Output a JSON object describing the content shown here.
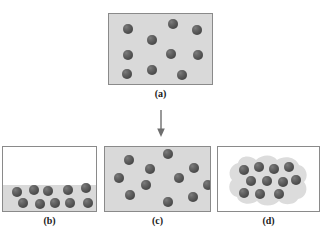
{
  "figure": {
    "background_color": "#ffffff",
    "panel_fill_color": "#d9d9d9",
    "panel_border_color": "#8a8a8a",
    "sphere_color": "#4e4e4e",
    "blob_color": "#dcdcdc"
  },
  "arrow": {
    "name": "down-arrow",
    "color": "#6e6e6e",
    "x": 161,
    "y_start": 110,
    "y_end": 137
  },
  "panels": [
    {
      "id": "a",
      "label": "(a)",
      "x": 108,
      "y": 13,
      "w": 105,
      "h": 72,
      "fill": "full",
      "label_x": 108,
      "label_y": 88,
      "label_w": 105,
      "sphere_count": 10,
      "sphere_radius": 5.2,
      "spheres": [
        {
          "cx": 19,
          "cy": 15
        },
        {
          "cx": 64,
          "cy": 10
        },
        {
          "cx": 88,
          "cy": 16
        },
        {
          "cx": 43,
          "cy": 26
        },
        {
          "cx": 19,
          "cy": 41
        },
        {
          "cx": 62,
          "cy": 40
        },
        {
          "cx": 89,
          "cy": 41
        },
        {
          "cx": 18,
          "cy": 60
        },
        {
          "cx": 43,
          "cy": 56
        },
        {
          "cx": 73,
          "cy": 61
        }
      ]
    },
    {
      "id": "b",
      "label": "(b)",
      "x": 2,
      "y": 146,
      "w": 95,
      "h": 66,
      "fill": "liquid",
      "liquid_height": 26,
      "label_x": 2,
      "label_y": 215,
      "label_w": 95,
      "sphere_count": 10,
      "sphere_radius": 5.2,
      "spheres": [
        {
          "cx": 14,
          "cy": 45
        },
        {
          "cx": 31,
          "cy": 43
        },
        {
          "cx": 45,
          "cy": 44
        },
        {
          "cx": 65,
          "cy": 43
        },
        {
          "cx": 83,
          "cy": 41
        },
        {
          "cx": 20,
          "cy": 56
        },
        {
          "cx": 37,
          "cy": 57
        },
        {
          "cx": 52,
          "cy": 56
        },
        {
          "cx": 67,
          "cy": 56
        },
        {
          "cx": 85,
          "cy": 56
        }
      ]
    },
    {
      "id": "c",
      "label": "(c)",
      "x": 104,
      "y": 146,
      "w": 107,
      "h": 66,
      "fill": "full",
      "label_x": 104,
      "label_y": 215,
      "label_w": 107,
      "sphere_count": 11,
      "sphere_radius": 5.2,
      "spheres": [
        {
          "cx": 24,
          "cy": 13
        },
        {
          "cx": 63,
          "cy": 7
        },
        {
          "cx": 45,
          "cy": 22
        },
        {
          "cx": 89,
          "cy": 21
        },
        {
          "cx": 14,
          "cy": 31
        },
        {
          "cx": 74,
          "cy": 31
        },
        {
          "cx": 41,
          "cy": 38
        },
        {
          "cx": 25,
          "cy": 48
        },
        {
          "cx": 63,
          "cy": 55
        },
        {
          "cx": 88,
          "cy": 50
        },
        {
          "cx": 103,
          "cy": 38
        }
      ]
    },
    {
      "id": "d",
      "label": "(d)",
      "x": 217,
      "y": 146,
      "w": 103,
      "h": 66,
      "fill": "white",
      "has_blob": true,
      "label_x": 217,
      "label_y": 215,
      "label_w": 103,
      "sphere_count": 11,
      "sphere_radius": 5.2,
      "spheres": [
        {
          "cx": 26,
          "cy": 23
        },
        {
          "cx": 41,
          "cy": 20
        },
        {
          "cx": 56,
          "cy": 22
        },
        {
          "cx": 71,
          "cy": 20
        },
        {
          "cx": 33,
          "cy": 34
        },
        {
          "cx": 49,
          "cy": 34
        },
        {
          "cx": 65,
          "cy": 35
        },
        {
          "cx": 78,
          "cy": 33
        },
        {
          "cx": 26,
          "cy": 46
        },
        {
          "cx": 42,
          "cy": 47
        },
        {
          "cx": 61,
          "cy": 47
        }
      ]
    }
  ]
}
